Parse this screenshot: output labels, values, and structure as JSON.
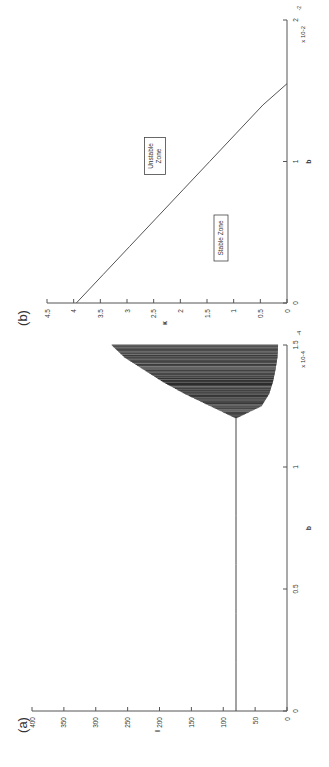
{
  "figure": {
    "orientation": "rotated-90-ccw",
    "panel_a_label": "(a)",
    "panel_b_label": "(b)"
  },
  "chart_data": [
    {
      "panel": "(a)",
      "type": "line",
      "title": "",
      "xlabel": "b",
      "ylabel": "I",
      "x_multiplier": "x 10^-4",
      "xlim": [
        0,
        1.5
      ],
      "ylim": [
        0,
        400
      ],
      "x_ticks": [
        "0",
        "0.5",
        "1",
        "1.5"
      ],
      "y_ticks": [
        "0",
        "50",
        "100",
        "150",
        "200",
        "250",
        "300",
        "350",
        "400"
      ],
      "grid": false,
      "series": [
        {
          "name": "steady state",
          "x": [
            0,
            0.2,
            0.4,
            0.6,
            0.8,
            1.0,
            1.2
          ],
          "y": [
            80,
            80,
            80,
            80,
            80,
            80,
            80
          ]
        },
        {
          "name": "oscillation upper envelope",
          "x": [
            1.2,
            1.25,
            1.3,
            1.35,
            1.4,
            1.45,
            1.5
          ],
          "y": [
            80,
            120,
            160,
            195,
            225,
            255,
            275
          ]
        },
        {
          "name": "oscillation lower envelope",
          "x": [
            1.2,
            1.25,
            1.3,
            1.35,
            1.4,
            1.45,
            1.5
          ],
          "y": [
            80,
            40,
            28,
            22,
            18,
            15,
            14
          ]
        }
      ],
      "annotations": [
        "dense periodic oscillations (shaded band) for b > ~1.2e-4"
      ]
    },
    {
      "panel": "(b)",
      "type": "line",
      "title": "",
      "xlabel": "b",
      "ylabel": "κ",
      "x_multiplier": "x 10^-2",
      "xlim": [
        0,
        2
      ],
      "ylim": [
        0,
        4.5
      ],
      "x_ticks": [
        "0",
        "1",
        "2"
      ],
      "y_ticks": [
        "0",
        "0.5",
        "1",
        "1.5",
        "2",
        "2.5",
        "3",
        "3.5",
        "4",
        "4.5"
      ],
      "grid": false,
      "series": [
        {
          "name": "stability boundary",
          "x": [
            0,
            0.2,
            0.4,
            0.6,
            0.8,
            1.0,
            1.2,
            1.4,
            1.5,
            1.55
          ],
          "y": [
            3.95,
            3.45,
            2.95,
            2.45,
            1.95,
            1.45,
            0.95,
            0.45,
            0.15,
            0
          ]
        }
      ],
      "annotations": [
        "Unstable Zone",
        "Stable Zone"
      ]
    }
  ]
}
